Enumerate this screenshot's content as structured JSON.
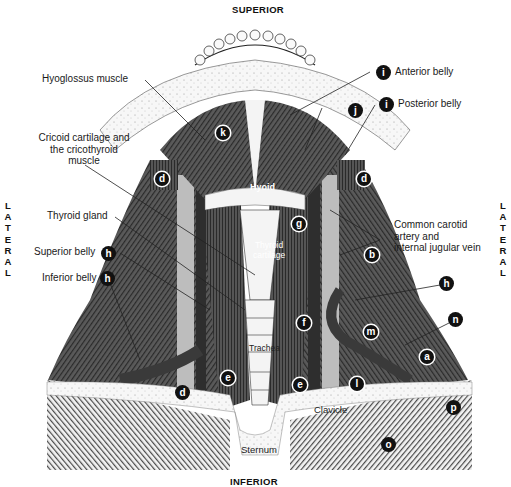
{
  "orientation": {
    "top": "SUPERIOR",
    "bottom": "INFERIOR",
    "left": [
      "L",
      "A",
      "T",
      "E",
      "R",
      "A",
      "L"
    ],
    "right": [
      "L",
      "A",
      "T",
      "E",
      "R",
      "A",
      "L"
    ]
  },
  "labels": {
    "hyoglossus": "Hyoglossus muscle",
    "anterior_belly": "Anterior belly",
    "posterior_belly": "Posterior belly",
    "cricoid_1": "Cricoid cartilage and",
    "cricoid_2": "the cricothyroid",
    "cricoid_3": "muscle",
    "thyroid_gland": "Thyroid gland",
    "superior_belly": "Superior belly",
    "inferior_belly": "Inferior belly",
    "carotid_1": "Common carotid",
    "carotid_2": "artery and",
    "carotid_3": "internal jugular vein"
  },
  "inner_labels": {
    "hyoid": "Hyoid",
    "thyroid_cartilage_1": "Thyroid",
    "thyroid_cartilage_2": "cartilage",
    "trachea": "Trachea",
    "clavicle": "Clavicle",
    "sternum": "Sternum"
  },
  "badges": {
    "i_anterior": "i",
    "i_posterior": "i",
    "j": "j",
    "k": "k",
    "d_left_upper": "d",
    "d_right_upper": "d",
    "d_left_lower": "d",
    "g": "g",
    "b": "b",
    "h_superior": "h",
    "h_inferior": "h",
    "h_right": "h",
    "n": "n",
    "m": "m",
    "f": "f",
    "a": "a",
    "e_left": "e",
    "e_right": "e",
    "l": "l",
    "p": "p",
    "o": "o"
  },
  "colors": {
    "muscle": "#4a4a4a",
    "muscle_dark": "#2e2e2e",
    "vessel": "#bdbdbd",
    "bone": "#f4f4f4",
    "badge": "#111111"
  }
}
